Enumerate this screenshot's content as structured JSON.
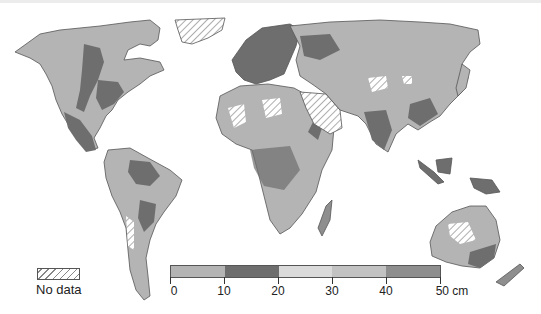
{
  "map": {
    "type": "choropleth",
    "projection": "world",
    "variable_unit": "cm",
    "no_data_pattern": "diagonal-hatch"
  },
  "legend": {
    "no_data_label": "No data",
    "unit": "cm",
    "ticks": [
      "0",
      "10",
      "20",
      "30",
      "40",
      "50 cm"
    ],
    "classes": [
      {
        "range": "0–10",
        "color": "#b4b4b4"
      },
      {
        "range": "10–20",
        "color": "#6e6e6e"
      },
      {
        "range": "20–30",
        "color": "#dadada"
      },
      {
        "range": "30–40",
        "color": "#c2c2c2"
      },
      {
        "range": "40–50",
        "color": "#8e8e8e"
      }
    ]
  },
  "colors": {
    "land_base": "#b4b4b4",
    "land_dark": "#6e6e6e",
    "border": "#555555",
    "ocean": "#ffffff"
  }
}
